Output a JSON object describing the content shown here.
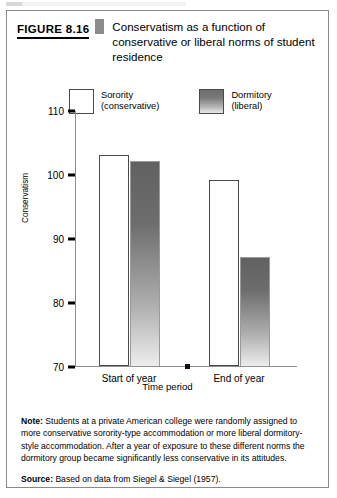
{
  "figure": {
    "number_label": "FIGURE 8.16",
    "title": "Conservatism as a function of conservative or liberal norms of student residence"
  },
  "chart_data": {
    "type": "bar",
    "title": "",
    "categories": [
      "Start of year",
      "End of year"
    ],
    "series": [
      {
        "name": "Sorority (conservative)",
        "values": [
          103,
          99
        ],
        "color": "#ffffff"
      },
      {
        "name": "Dormitory (liberal)",
        "values": [
          102,
          87
        ],
        "color": "#6d6d6d"
      }
    ],
    "xlabel": "Time period",
    "ylabel": "Conservatism",
    "ylim": [
      70,
      110
    ],
    "yticks": [
      110,
      100,
      90,
      80,
      70
    ],
    "grid": false,
    "legend_position": "top"
  },
  "legend": [
    {
      "name": "Sorority",
      "qualifier": "(conservative)"
    },
    {
      "name": "Dormitory",
      "qualifier": "(liberal)"
    }
  ],
  "notes": {
    "note_label": "Note:",
    "note_text": " Students at a private American college were randomly assigned to more conservative sorority-type accommodation or more liberal dormitory-style accommodation. After a year of exposure to these different norms the dormitory group became significantly less conservative in its attitudes.",
    "source_label": "Source:",
    "source_text": " Based on data from Siegel & Siegel (1957)."
  }
}
